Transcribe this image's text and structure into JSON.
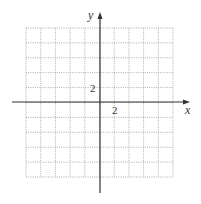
{
  "diagram": {
    "type": "coordinate-grid",
    "axes": {
      "x_label": "x",
      "y_label": "y"
    },
    "tick_labels": {
      "x_tick": "2",
      "y_tick": "2"
    },
    "grid": {
      "columns": 10,
      "rows": 10,
      "units_per_cell": 1,
      "x_range": [
        -5,
        5
      ],
      "y_range": [
        -5,
        5
      ]
    },
    "colors": {
      "grid": "#9a9a9a",
      "axis": "#333333",
      "background": "#ffffff"
    }
  }
}
